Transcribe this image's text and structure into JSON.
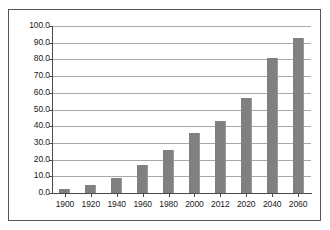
{
  "chart_data": {
    "type": "bar",
    "title": "",
    "subtitle": "",
    "xlabel": "",
    "ylabel": "",
    "categories": [
      "1900",
      "1920",
      "1940",
      "1960",
      "1980",
      "2000",
      "2012",
      "2020",
      "2040",
      "2060"
    ],
    "values": [
      2.5,
      4.8,
      9.0,
      16.5,
      26.0,
      36.0,
      43.0,
      57.0,
      81.0,
      93.0
    ],
    "ylim": [
      0.0,
      100.0
    ],
    "y_ticks": [
      0.0,
      10.0,
      20.0,
      30.0,
      40.0,
      50.0,
      60.0,
      70.0,
      80.0,
      90.0,
      100.0
    ],
    "y_tick_labels": [
      "0.0",
      "10.0",
      "20.0",
      "30.0",
      "40.0",
      "50.0",
      "60.0",
      "70.0",
      "80.0",
      "90.0",
      "100.0"
    ],
    "x_tick_labels": [
      "1900",
      "1920",
      "1940",
      "1960",
      "1980",
      "2000",
      "2012",
      "2020",
      "2040",
      "2060"
    ],
    "grid": true,
    "grid_axis": "y",
    "legend": null,
    "legend_position": "none",
    "annotations": [],
    "series": [
      {
        "name": "",
        "values": [
          2.5,
          4.8,
          9.0,
          16.5,
          26.0,
          36.0,
          43.0,
          57.0,
          81.0,
          93.0
        ]
      }
    ]
  },
  "colors": {
    "bar_fill": "#808080",
    "bar_edge": "#9a9a9a",
    "gridline": "#a8a8a8",
    "axis_line": "#4a4a4a",
    "frame_border": "#555555",
    "background": "#ffffff",
    "tick_label": "#1a1a1a"
  },
  "figure": {
    "frame_visible": true
  }
}
